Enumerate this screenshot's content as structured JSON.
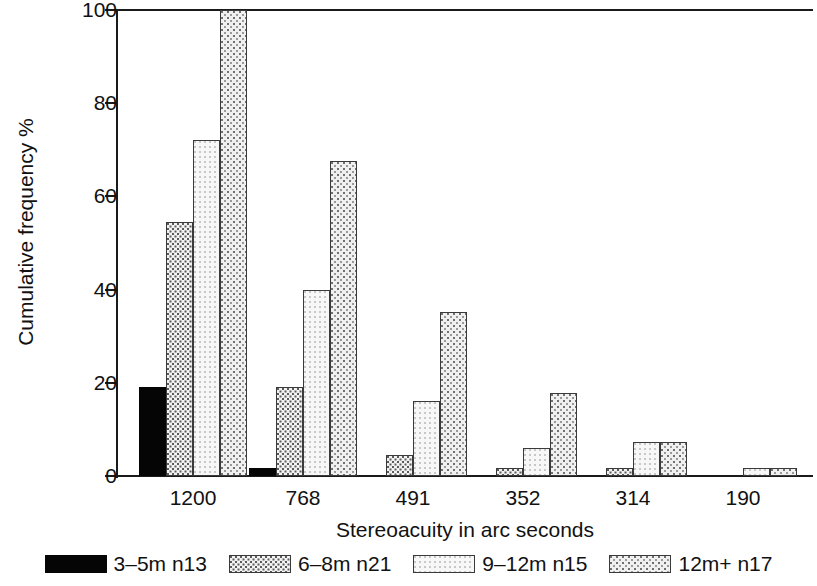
{
  "chart_data": {
    "type": "bar",
    "title": "",
    "xlabel": "Stereoacuity in arc seconds",
    "ylabel": "Cumulative frequency %",
    "categories": [
      "1200",
      "768",
      "491",
      "352",
      "314",
      "190"
    ],
    "ylim": [
      0,
      100
    ],
    "yticks": [
      0,
      20,
      40,
      60,
      80,
      100
    ],
    "ytick_labels": [
      "0",
      "20",
      "40",
      "60",
      "80",
      "100"
    ],
    "grid": false,
    "legend_position": "bottom",
    "series": [
      {
        "name": "3–5m n13",
        "pattern": "solid-black",
        "color": "#050505",
        "values": [
          19.0,
          1.7,
          0,
          0,
          0,
          0
        ]
      },
      {
        "name": "6–8m n21",
        "pattern": "dense-stipple",
        "color": "#f2f2f2",
        "values": [
          54.5,
          19.0,
          4.6,
          1.8,
          1.7,
          0
        ]
      },
      {
        "name": "9–12m n15",
        "pattern": "light-stipple",
        "color": "#f7f7f7",
        "values": [
          72.0,
          40.0,
          16.0,
          6.0,
          7.3,
          1.7
        ]
      },
      {
        "name": "12m+ n17",
        "pattern": "medium-stipple",
        "color": "#f0f0f0",
        "values": [
          100.0,
          67.5,
          35.3,
          17.8,
          7.3,
          1.7
        ]
      }
    ]
  },
  "axes": {
    "y_title": "Cumulative frequency %",
    "x_title": "Stereoacuity in arc seconds",
    "y_tick_labels": [
      "100",
      "80",
      "60",
      "40",
      "20",
      "0"
    ],
    "x_tick_labels": [
      "1200",
      "768",
      "491",
      "352",
      "314",
      "190"
    ]
  },
  "legend": {
    "items": [
      {
        "label": "3–5m n13",
        "swatch": "solid-black-swatch"
      },
      {
        "label": "6–8m n21",
        "swatch": "dense-stipple-swatch"
      },
      {
        "label": "9–12m n15",
        "swatch": "light-stipple-swatch"
      },
      {
        "label": "12m+ n17",
        "swatch": "medium-stipple-swatch"
      }
    ]
  }
}
